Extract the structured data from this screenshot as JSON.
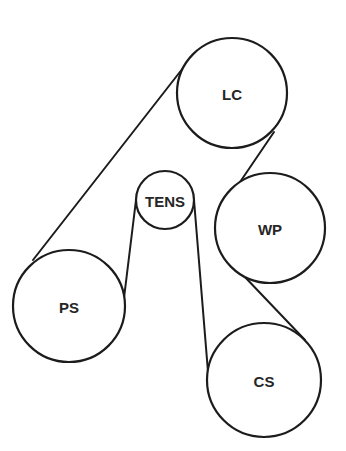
{
  "diagram": {
    "type": "serpentine-belt-routing",
    "pulleys": [
      {
        "id": "lc",
        "label": "LC",
        "cx": 232,
        "cy": 93,
        "r": 55
      },
      {
        "id": "tens",
        "label": "TENS",
        "cx": 165,
        "cy": 200,
        "r": 29
      },
      {
        "id": "wp",
        "label": "WP",
        "cx": 270,
        "cy": 228,
        "r": 55
      },
      {
        "id": "ps",
        "label": "PS",
        "cx": 69,
        "cy": 306,
        "r": 56
      },
      {
        "id": "cs",
        "label": "CS",
        "cx": 264,
        "cy": 380,
        "r": 57
      }
    ],
    "belt_segments": [
      {
        "from": "PS",
        "to": "LC",
        "x1": 33,
        "y1": 260,
        "x2": 183,
        "y2": 68
      },
      {
        "from": "LC",
        "to": "WP",
        "x1": 274,
        "y1": 132,
        "x2": 238,
        "y2": 185
      },
      {
        "from": "WP",
        "to": "CS",
        "x1": 243,
        "y1": 275,
        "x2": 305,
        "y2": 340
      },
      {
        "from": "CS",
        "to": "TENS",
        "x1": 208,
        "y1": 372,
        "x2": 194,
        "y2": 200
      },
      {
        "from": "TENS",
        "to": "PS",
        "x1": 136,
        "y1": 200,
        "x2": 124,
        "y2": 298
      }
    ],
    "colors": {
      "stroke": "#1c1c1c",
      "label": "#262626",
      "background": "#ffffff"
    }
  }
}
